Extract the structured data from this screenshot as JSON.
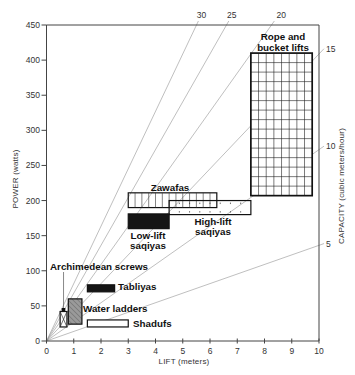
{
  "chart_data": {
    "type": "line",
    "title": "",
    "xlabel": "LIFT (meters)",
    "ylabel": "POWER (watts)",
    "y2label": "CAPACITY (cubic meters/hour)",
    "xlim": [
      0,
      10
    ],
    "ylim": [
      0,
      450
    ],
    "grid": false,
    "xticks": [
      "0",
      "1",
      "2",
      "3",
      "4",
      "5",
      "6",
      "7",
      "8",
      "9",
      "10"
    ],
    "yticks": [
      "0",
      "50",
      "100",
      "150",
      "200",
      "250",
      "300",
      "350",
      "400",
      "450"
    ],
    "capacity_lines": {
      "description": "Lines of constant pumping capacity from origin: power = k * capacity * lift",
      "k_watts_per_m3h_per_m": 2.725,
      "values": [
        {
          "label": "5",
          "capacity": 5
        },
        {
          "label": "10",
          "capacity": 10
        },
        {
          "label": "15",
          "capacity": 15
        },
        {
          "label": "20",
          "capacity": 20
        },
        {
          "label": "25",
          "capacity": 25
        },
        {
          "label": "30",
          "capacity": 30
        }
      ]
    },
    "regions": [
      {
        "name": "Rope and bucket lifts",
        "label_lines": [
          "Rope and",
          "bucket lifts"
        ],
        "lift": [
          7.5,
          9.75
        ],
        "power": [
          207,
          410
        ],
        "style": "grid"
      },
      {
        "name": "Zawafas",
        "label_lines": [
          "Zawafas"
        ],
        "lift": [
          3.0,
          6.25
        ],
        "power": [
          190,
          211
        ],
        "style": "vlines"
      },
      {
        "name": "High-lift saqiyas",
        "label_lines": [
          "High-lift",
          "saqiyas"
        ],
        "lift": [
          4.5,
          7.5
        ],
        "power": [
          180,
          200
        ],
        "style": "ticks"
      },
      {
        "name": "Low-lift saqiyas",
        "label_lines": [
          "Low-lift",
          "saqiyas"
        ],
        "lift": [
          3.0,
          4.5
        ],
        "power": [
          160,
          181
        ],
        "style": "solid"
      },
      {
        "name": "Archimedean screws",
        "label_lines": [
          "Archimedean screws"
        ],
        "lift": [
          0.5,
          0.75
        ],
        "power": [
          20,
          42
        ],
        "style": "cross"
      },
      {
        "name": "Tabliyas",
        "label_lines": [
          "Tabliyas"
        ],
        "lift": [
          1.5,
          2.5
        ],
        "power": [
          70,
          80
        ],
        "style": "solid"
      },
      {
        "name": "Water ladders",
        "label_lines": [
          "Water ladders"
        ],
        "lift": [
          0.8,
          1.3
        ],
        "power": [
          24,
          60
        ],
        "style": "hatch"
      },
      {
        "name": "Shadufs",
        "label_lines": [
          "Shadufs"
        ],
        "lift": [
          1.5,
          3.0
        ],
        "power": [
          20,
          30
        ],
        "style": "plain"
      }
    ],
    "colors": {
      "axis": "#444444",
      "capacity_line": "#8a8a8a",
      "solid_fill": "#151515",
      "hatch_fill": "#9a9a9a",
      "outline": "#111111"
    }
  }
}
